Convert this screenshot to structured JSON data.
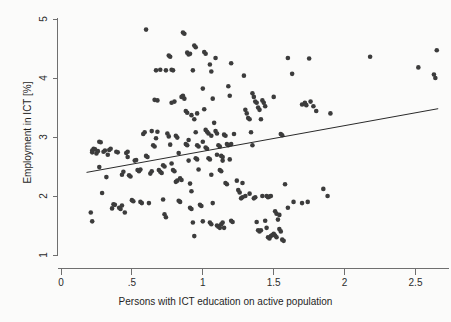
{
  "chart_data": {
    "type": "scatter",
    "title": "",
    "xlabel": "Persons with ICT education on active population",
    "ylabel": "Employment in ICT [%]",
    "xlim": [
      0,
      2.72
    ],
    "ylim": [
      1,
      5.05
    ],
    "xticks": [
      0,
      0.5,
      1,
      1.5,
      2,
      2.5
    ],
    "xticklabels": [
      "0",
      ".5",
      "1",
      "1.5",
      "2",
      "2.5"
    ],
    "yticks": [
      1,
      2,
      3,
      4,
      5
    ],
    "yticklabels": [
      "1",
      "2",
      "3",
      "4",
      "5"
    ],
    "grid": false,
    "legend": null,
    "marker_color": "#3c3c3c",
    "marker_size_px": 4.6,
    "axis_color": "#6f6f6f",
    "fit_line": {
      "type": "linear",
      "color": "#2a2a2a",
      "x_start": 0.18,
      "y_start": 2.4,
      "x_end": 2.66,
      "y_end": 3.48,
      "slope": 0.435,
      "intercept": 2.322
    },
    "points": [
      [
        0.22,
        2.74
      ],
      [
        0.22,
        2.77
      ],
      [
        0.23,
        2.8
      ],
      [
        0.21,
        1.72
      ],
      [
        0.22,
        1.57
      ],
      [
        0.25,
        2.72
      ],
      [
        0.26,
        2.76
      ],
      [
        0.27,
        2.92
      ],
      [
        0.28,
        2.91
      ],
      [
        0.27,
        2.49
      ],
      [
        0.29,
        2.05
      ],
      [
        0.31,
        2.77
      ],
      [
        0.32,
        2.32
      ],
      [
        0.34,
        2.78
      ],
      [
        0.35,
        2.8
      ],
      [
        0.36,
        1.79
      ],
      [
        0.37,
        1.86
      ],
      [
        0.38,
        1.85
      ],
      [
        0.39,
        2.75
      ],
      [
        0.4,
        2.74
      ],
      [
        0.41,
        1.8
      ],
      [
        0.42,
        1.78
      ],
      [
        0.43,
        2.36
      ],
      [
        0.44,
        2.41
      ],
      [
        0.45,
        1.72
      ],
      [
        0.46,
        2.73
      ],
      [
        0.47,
        2.75
      ],
      [
        0.48,
        2.35
      ],
      [
        0.49,
        2.33
      ],
      [
        0.5,
        1.93
      ],
      [
        0.51,
        1.91
      ],
      [
        0.52,
        2.6
      ],
      [
        0.53,
        2.61
      ],
      [
        0.54,
        2.44
      ],
      [
        0.55,
        2.42
      ],
      [
        0.56,
        1.9
      ],
      [
        0.57,
        1.88
      ],
      [
        0.58,
        3.05
      ],
      [
        0.59,
        3.08
      ],
      [
        0.6,
        4.82
      ],
      [
        0.6,
        2.68
      ],
      [
        0.61,
        2.66
      ],
      [
        0.62,
        1.88
      ],
      [
        0.63,
        2.38
      ],
      [
        0.64,
        2.42
      ],
      [
        0.65,
        2.86
      ],
      [
        0.66,
        2.84
      ],
      [
        0.67,
        2.98
      ],
      [
        0.68,
        3.09
      ],
      [
        0.69,
        2.44
      ],
      [
        0.7,
        2.41
      ],
      [
        0.71,
        2.39
      ],
      [
        0.72,
        1.94
      ],
      [
        0.73,
        1.69
      ],
      [
        0.74,
        1.64
      ],
      [
        0.66,
        3.63
      ],
      [
        0.67,
        4.13
      ],
      [
        0.7,
        4.14
      ],
      [
        0.72,
        2.52
      ],
      [
        0.73,
        2.5
      ],
      [
        0.75,
        3.06
      ],
      [
        0.76,
        3.01
      ],
      [
        0.77,
        2.87
      ],
      [
        0.78,
        2.55
      ],
      [
        0.79,
        2.44
      ],
      [
        0.8,
        2.42
      ],
      [
        0.81,
        2.24
      ],
      [
        0.82,
        2.26
      ],
      [
        0.83,
        1.92
      ],
      [
        0.84,
        1.9
      ],
      [
        0.76,
        4.38
      ],
      [
        0.77,
        4.36
      ],
      [
        0.78,
        4.14
      ],
      [
        0.79,
        4.13
      ],
      [
        0.8,
        3.6
      ],
      [
        0.81,
        3.02
      ],
      [
        0.82,
        2.99
      ],
      [
        0.83,
        2.73
      ],
      [
        0.84,
        2.3
      ],
      [
        0.85,
        2.27
      ],
      [
        0.86,
        4.77
      ],
      [
        0.87,
        4.75
      ],
      [
        0.86,
        3.7
      ],
      [
        0.87,
        3.65
      ],
      [
        0.88,
        3.44
      ],
      [
        0.89,
        3.41
      ],
      [
        0.88,
        2.88
      ],
      [
        0.89,
        2.86
      ],
      [
        0.9,
        2.6
      ],
      [
        0.91,
        2.21
      ],
      [
        0.92,
        2.08
      ],
      [
        0.91,
        1.8
      ],
      [
        0.92,
        1.78
      ],
      [
        0.93,
        1.55
      ],
      [
        0.94,
        1.32
      ],
      [
        0.89,
        4.43
      ],
      [
        0.9,
        4.4
      ],
      [
        0.91,
        4.41
      ],
      [
        0.93,
        4.13
      ],
      [
        0.92,
        3.37
      ],
      [
        0.94,
        3.3
      ],
      [
        0.95,
        3.08
      ],
      [
        0.96,
        2.86
      ],
      [
        0.97,
        2.84
      ],
      [
        0.95,
        2.64
      ],
      [
        0.96,
        2.62
      ],
      [
        0.97,
        2.45
      ],
      [
        0.98,
        1.85
      ],
      [
        0.99,
        1.83
      ],
      [
        1.0,
        1.57
      ],
      [
        0.94,
        4.55
      ],
      [
        0.95,
        4.52
      ],
      [
        1.0,
        3.82
      ],
      [
        1.01,
        3.47
      ],
      [
        1.02,
        3.12
      ],
      [
        1.03,
        3.09
      ],
      [
        1.04,
        3.06
      ],
      [
        1.02,
        2.82
      ],
      [
        1.03,
        2.8
      ],
      [
        1.04,
        2.64
      ],
      [
        1.05,
        2.62
      ],
      [
        1.06,
        2.36
      ],
      [
        1.07,
        1.88
      ],
      [
        1.05,
        1.55
      ],
      [
        1.06,
        1.52
      ],
      [
        1.01,
        4.44
      ],
      [
        1.02,
        4.41
      ],
      [
        1.05,
        4.23
      ],
      [
        1.06,
        4.11
      ],
      [
        1.07,
        3.65
      ],
      [
        1.08,
        3.24
      ],
      [
        1.09,
        3.1
      ],
      [
        1.1,
        3.06
      ],
      [
        1.11,
        2.86
      ],
      [
        1.12,
        2.84
      ],
      [
        1.13,
        2.68
      ],
      [
        1.14,
        2.66
      ],
      [
        1.12,
        2.44
      ],
      [
        1.13,
        2.42
      ],
      [
        1.1,
        1.5
      ],
      [
        1.11,
        1.48
      ],
      [
        1.12,
        1.46
      ],
      [
        1.13,
        1.52
      ],
      [
        1.14,
        1.55
      ],
      [
        1.15,
        1.46
      ],
      [
        1.09,
        4.34
      ],
      [
        1.15,
        3.04
      ],
      [
        1.16,
        3.02
      ],
      [
        1.17,
        2.88
      ],
      [
        1.18,
        2.86
      ],
      [
        1.19,
        2.62
      ],
      [
        1.16,
        2.22
      ],
      [
        1.17,
        2.2
      ],
      [
        1.2,
        1.58
      ],
      [
        1.21,
        1.56
      ],
      [
        1.18,
        3.86
      ],
      [
        1.19,
        3.7
      ],
      [
        1.2,
        4.25
      ],
      [
        1.22,
        3.05
      ],
      [
        1.24,
        2.26
      ],
      [
        1.25,
        2.1
      ],
      [
        1.26,
        2.06
      ],
      [
        1.27,
        1.96
      ],
      [
        1.28,
        1.98
      ],
      [
        1.3,
        2.0
      ],
      [
        1.29,
        4.04
      ],
      [
        1.3,
        3.46
      ],
      [
        1.31,
        3.4
      ],
      [
        1.32,
        3.32
      ],
      [
        1.33,
        3.3
      ],
      [
        1.34,
        3.08
      ],
      [
        1.35,
        2.86
      ],
      [
        1.36,
        1.96
      ],
      [
        1.37,
        1.98
      ],
      [
        1.38,
        1.56
      ],
      [
        1.39,
        1.42
      ],
      [
        1.4,
        1.4
      ],
      [
        1.41,
        1.42
      ],
      [
        1.35,
        3.74
      ],
      [
        1.36,
        3.68
      ],
      [
        1.37,
        3.6
      ],
      [
        1.38,
        3.58
      ],
      [
        1.39,
        3.5
      ],
      [
        1.4,
        3.46
      ],
      [
        1.41,
        3.3
      ],
      [
        1.42,
        3.62
      ],
      [
        1.43,
        3.58
      ],
      [
        1.44,
        3.52
      ],
      [
        1.45,
        2.0
      ],
      [
        1.46,
        1.98
      ],
      [
        1.47,
        1.99
      ],
      [
        1.44,
        1.58
      ],
      [
        1.45,
        1.46
      ],
      [
        1.46,
        1.3
      ],
      [
        1.47,
        1.28
      ],
      [
        1.48,
        1.32
      ],
      [
        1.49,
        1.34
      ],
      [
        1.5,
        1.36
      ],
      [
        1.51,
        1.33
      ],
      [
        1.52,
        1.3
      ],
      [
        1.5,
        3.68
      ],
      [
        1.51,
        1.74
      ],
      [
        1.52,
        1.7
      ],
      [
        1.53,
        1.6
      ],
      [
        1.54,
        1.44
      ],
      [
        1.55,
        1.4
      ],
      [
        1.56,
        1.26
      ],
      [
        1.57,
        1.24
      ],
      [
        1.55,
        3.05
      ],
      [
        1.56,
        3.03
      ],
      [
        1.58,
        2.2
      ],
      [
        1.6,
        4.34
      ],
      [
        1.63,
        4.07
      ],
      [
        1.7,
        3.55
      ],
      [
        1.72,
        3.58
      ],
      [
        1.73,
        3.54
      ],
      [
        1.75,
        4.33
      ],
      [
        1.76,
        3.6
      ],
      [
        1.78,
        3.52
      ],
      [
        1.8,
        3.44
      ],
      [
        1.7,
        1.88
      ],
      [
        1.74,
        1.9
      ],
      [
        1.85,
        2.12
      ],
      [
        1.88,
        2.0
      ],
      [
        1.9,
        3.4
      ],
      [
        2.18,
        4.36
      ],
      [
        2.52,
        4.18
      ],
      [
        2.63,
        4.06
      ],
      [
        2.64,
        4.0
      ],
      [
        2.65,
        4.47
      ],
      [
        0.24,
        2.79
      ],
      [
        0.3,
        2.75
      ],
      [
        0.33,
        2.7
      ],
      [
        0.43,
        1.84
      ],
      [
        0.47,
        2.66
      ],
      [
        0.56,
        2.45
      ],
      [
        0.64,
        3.1
      ],
      [
        0.68,
        3.62
      ],
      [
        0.74,
        4.13
      ],
      [
        0.78,
        3.58
      ],
      [
        0.85,
        3.68
      ],
      [
        0.9,
        2.95
      ],
      [
        0.96,
        3.4
      ],
      [
        1.0,
        2.92
      ],
      [
        1.06,
        3.02
      ],
      [
        1.1,
        2.7
      ],
      [
        1.14,
        2.6
      ],
      [
        1.2,
        2.88
      ],
      [
        1.28,
        2.22
      ],
      [
        1.33,
        2.04
      ],
      [
        1.42,
        2.0
      ],
      [
        1.48,
        2.0
      ],
      [
        1.54,
        1.68
      ],
      [
        1.6,
        1.8
      ],
      [
        1.64,
        1.9
      ]
    ]
  }
}
